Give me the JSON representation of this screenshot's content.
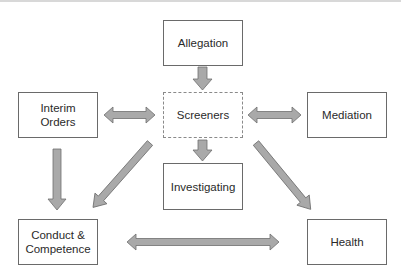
{
  "diagram": {
    "nodes": [
      {
        "id": "allegation",
        "label": "Allegation",
        "style": "solid"
      },
      {
        "id": "screeners",
        "label": "Screeners",
        "style": "dashed"
      },
      {
        "id": "investigating",
        "label": "Investigating",
        "style": "solid"
      },
      {
        "id": "interim_orders",
        "label": "Interim\nOrders",
        "style": "solid"
      },
      {
        "id": "mediation",
        "label": "Mediation",
        "style": "solid"
      },
      {
        "id": "conduct_competence",
        "label": "Conduct &\nCompetence",
        "style": "solid"
      },
      {
        "id": "health",
        "label": "Health",
        "style": "solid"
      }
    ],
    "edges": [
      {
        "from": "allegation",
        "to": "screeners",
        "direction": "one-way"
      },
      {
        "from": "screeners",
        "to": "investigating",
        "direction": "one-way"
      },
      {
        "from": "screeners",
        "to": "interim_orders",
        "direction": "two-way"
      },
      {
        "from": "screeners",
        "to": "mediation",
        "direction": "two-way"
      },
      {
        "from": "screeners",
        "to": "conduct_competence",
        "direction": "one-way"
      },
      {
        "from": "screeners",
        "to": "health",
        "direction": "one-way"
      },
      {
        "from": "interim_orders",
        "to": "conduct_competence",
        "direction": "one-way"
      },
      {
        "from": "conduct_competence",
        "to": "health",
        "direction": "two-way"
      }
    ],
    "colors": {
      "box_border": "#6a6a6a",
      "arrow_fill": "#a9a9a9",
      "arrow_stroke": "#6e6e6e",
      "text": "#2a2a2a"
    }
  }
}
